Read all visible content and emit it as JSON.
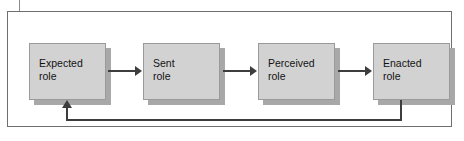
{
  "figure": {
    "type": "linear-process-flow-with-feedback",
    "frame": {
      "visible": true,
      "border_color": "#6f6f6f",
      "background": "#ffffff"
    },
    "node_style": {
      "fill": "#d2d2d2",
      "border_color": "#9a9a9a",
      "shadow_color": "#a8a8a8",
      "text_color": "#121212"
    },
    "connector_color": "#3d3d3d",
    "nodes": [
      {
        "id": "expected-role",
        "label": "Expected\nrole",
        "order": 1
      },
      {
        "id": "sent-role",
        "label": "Sent\nrole",
        "order": 2
      },
      {
        "id": "perceived-role",
        "label": "Perceived\nrole",
        "order": 3
      },
      {
        "id": "enacted-role",
        "label": "Enacted\nrole",
        "order": 4
      }
    ],
    "connectors": [
      {
        "id": "arrow-expected-to-sent",
        "from": "expected-role",
        "to": "sent-role",
        "kind": "arrow",
        "direction": "right"
      },
      {
        "id": "arrow-sent-to-perceived",
        "from": "sent-role",
        "to": "perceived-role",
        "kind": "arrow",
        "direction": "right"
      },
      {
        "id": "arrow-perceived-to-enacted",
        "from": "perceived-role",
        "to": "enacted-role",
        "kind": "arrow",
        "direction": "right"
      },
      {
        "id": "feedback-enacted-to-expected",
        "from": "enacted-role",
        "to": "expected-role",
        "kind": "feedback-loop",
        "direction": "left-then-up"
      }
    ]
  }
}
